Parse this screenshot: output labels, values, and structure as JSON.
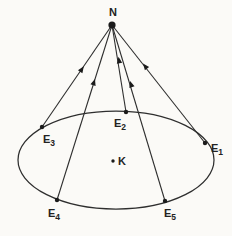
{
  "figure": {
    "colors": {
      "background": "#fbfaf7",
      "stroke": "#2e2e2e",
      "dot": "#1b1b1b",
      "text": "#222222"
    },
    "canvas": {
      "width": 232,
      "height": 236
    },
    "apex": {
      "label": "N",
      "x": 112,
      "y": 25,
      "dot_r": 3.6,
      "label_x": 113,
      "label_y": 16
    },
    "ellipse": {
      "cx": 116,
      "cy": 160,
      "rx": 98,
      "ry": 49
    },
    "interior_point": {
      "label": "K",
      "x": 113,
      "y": 161,
      "dot_r": 1.7,
      "label_x": 118,
      "label_y": 165
    },
    "edge_points": [
      {
        "label_base": "E",
        "label_sub": "3",
        "x": 42,
        "y": 127,
        "dot_r": 2.2,
        "label_x": 49,
        "label_y": 143,
        "arrow_x": 82,
        "arrow_y": 69
      },
      {
        "label_base": "E",
        "label_sub": "4",
        "x": 57,
        "y": 200,
        "dot_r": 2.2,
        "label_x": 54,
        "label_y": 217,
        "arrow_x": 94,
        "arrow_y": 82
      },
      {
        "label_base": "E",
        "label_sub": "2",
        "x": 126,
        "y": 112,
        "dot_r": 2.2,
        "label_x": 120,
        "label_y": 127,
        "arrow_x": 119,
        "arrow_y": 60
      },
      {
        "label_base": "E",
        "label_sub": "5",
        "x": 165,
        "y": 201,
        "dot_r": 2.2,
        "label_x": 170,
        "label_y": 217,
        "arrow_x": 131,
        "arrow_y": 84
      },
      {
        "label_base": "E",
        "label_sub": "1",
        "x": 205,
        "y": 143,
        "dot_r": 2.2,
        "label_x": 217,
        "label_y": 152,
        "arrow_x": 145,
        "arrow_y": 66
      }
    ],
    "style": {
      "line_width": 1.1,
      "ellipse_width": 1.25,
      "label_font_size": 11,
      "subscript_font_size": 8.5,
      "subscript_dy": 2.5,
      "arrow_length": 6.5,
      "arrow_half_width": 2.7
    }
  }
}
